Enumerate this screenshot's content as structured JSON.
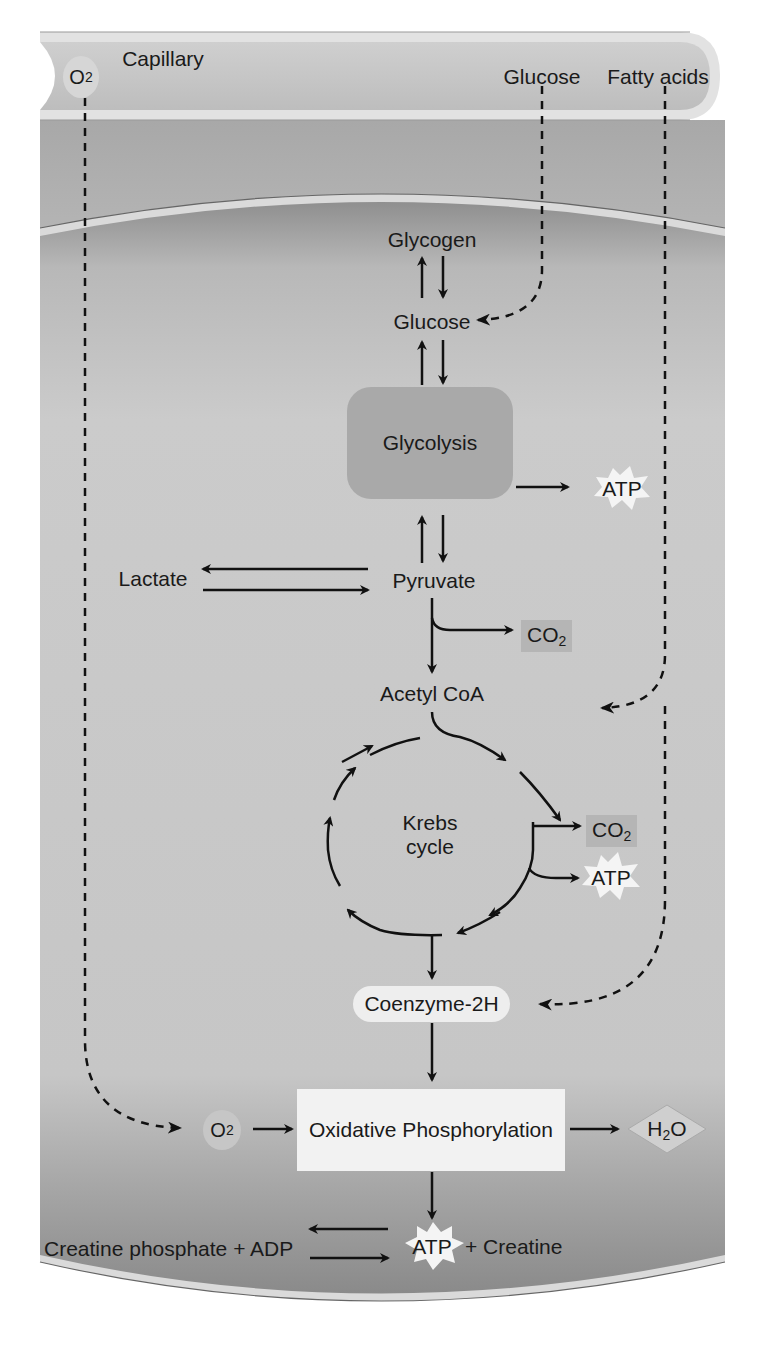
{
  "diagram": {
    "regions": {
      "capillary": "Capillary",
      "muscle_cell": "Muscle cell"
    },
    "capillary_substances": {
      "o2": "O",
      "o2_sub": "2",
      "glucose": "Glucose",
      "fatty_acids": "Fatty acids"
    },
    "pathway": {
      "glycogen": "Glycogen",
      "glucose": "Glucose",
      "glycolysis": "Glycolysis",
      "atp_glycolysis": "ATP",
      "pyruvate": "Pyruvate",
      "lactate": "Lactate",
      "co2_pyruvate": "CO",
      "co2_pyruvate_sub": "2",
      "acetyl_coa": "Acetyl CoA",
      "krebs_line1": "Krebs",
      "krebs_line2": "cycle",
      "co2_krebs": "CO",
      "co2_krebs_sub": "2",
      "atp_krebs": "ATP",
      "coenzyme": "Coenzyme-2H",
      "o2_cell": "O",
      "o2_cell_sub": "2",
      "oxphos": "Oxidative Phosphorylation",
      "h2o_h": "H",
      "h2o_sub": "2",
      "h2o_o": "O",
      "atp_final": "ATP",
      "creatine": "+ Creatine",
      "creatine_phosphate": "Creatine phosphate + ADP"
    },
    "colors": {
      "capillary_fill": "#c8c8c8",
      "cell_fill": "#c4c4c4",
      "glycolysis_box": "#a9a9a9",
      "oxphos_box": "#f2f2f2",
      "co2_box": "#b5b5b5",
      "atp_burst": "#f4f4f4",
      "arrow": "#111111"
    }
  }
}
